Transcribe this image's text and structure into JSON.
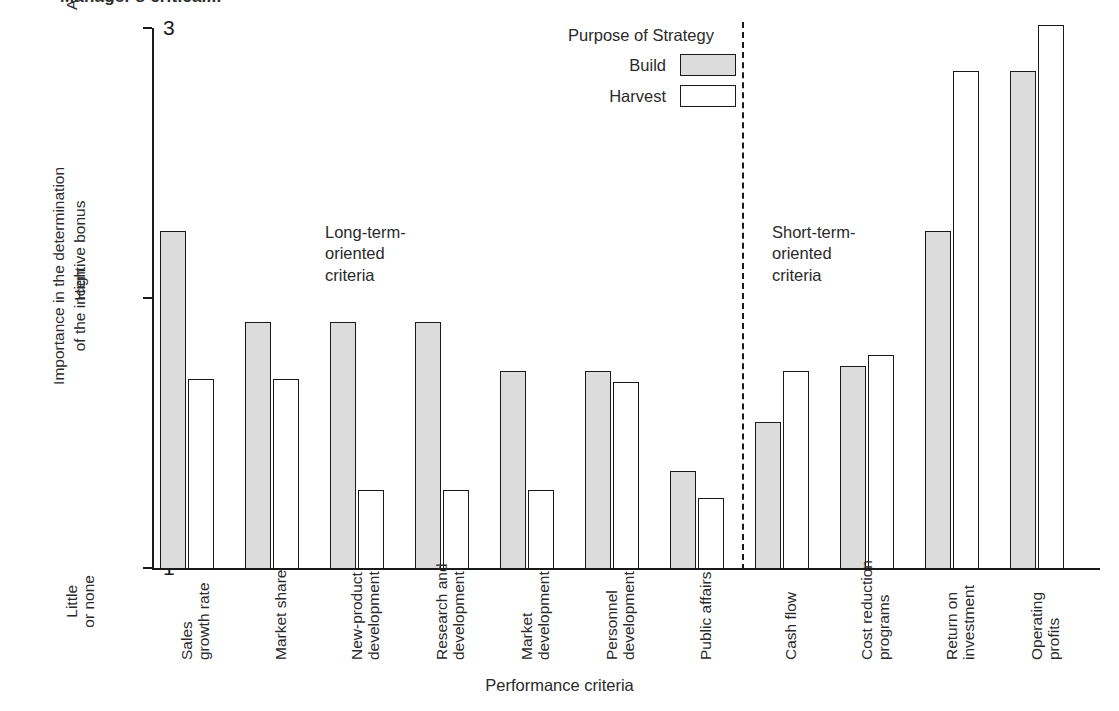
{
  "figure": {
    "cut_title": "Manager's critical...",
    "x_axis_title": "Performance criteria",
    "y_axis_title": "Importance in the determination\nof the incentive bonus",
    "annotations": [
      {
        "name": "long-term",
        "text": "Long-term-\noriented\ncriteria"
      },
      {
        "name": "short-term",
        "text": "Short-term-\noriented\ncriteria"
      }
    ],
    "legend": {
      "title": "Purpose of Strategy",
      "entries": [
        {
          "label": "Build",
          "swatch": "filled-gray",
          "color": "#dcdcdc"
        },
        {
          "label": "Harvest",
          "swatch": "white",
          "color": "#ffffff"
        }
      ]
    },
    "y_ticks": [
      {
        "value": "3",
        "words": "A great\ndeal"
      },
      {
        "value": "2",
        "words": "High"
      },
      {
        "value": "1",
        "words": "Little\nor none"
      }
    ]
  },
  "chart_data": {
    "type": "bar",
    "title": "",
    "xlabel": "Performance criteria",
    "ylabel": "Importance in the determination of the incentive bonus",
    "ylim": [
      1,
      3
    ],
    "ytick_values": [
      1,
      2,
      3
    ],
    "ytick_labels": [
      "Little or none",
      "High",
      "A great deal"
    ],
    "grid": false,
    "legend_position": "top-center",
    "categories": [
      "Sales growth rate",
      "Market share",
      "New-product development",
      "Research and development",
      "Market development",
      "Personnel development",
      "Public affairs",
      "Cash flow",
      "Cost reduction programs",
      "Return on investment",
      "Operating profits"
    ],
    "category_lines": [
      [
        "Sales",
        "growth rate"
      ],
      [
        "Market share"
      ],
      [
        "New-product",
        "development"
      ],
      [
        "Research and",
        "development"
      ],
      [
        "Market",
        "development"
      ],
      [
        "Personnel",
        "development"
      ],
      [
        "Public affairs"
      ],
      [
        "Cash flow"
      ],
      [
        "Cost reduction",
        "programs"
      ],
      [
        "Return on",
        "investment"
      ],
      [
        "Operating",
        "profits"
      ]
    ],
    "series": [
      {
        "name": "Build",
        "color": "#dcdcdc",
        "values": [
          2.25,
          1.91,
          1.91,
          1.91,
          1.73,
          1.73,
          1.36,
          1.54,
          1.75,
          2.25,
          2.84
        ]
      },
      {
        "name": "Harvest",
        "color": "#ffffff",
        "values": [
          1.7,
          1.7,
          1.29,
          1.29,
          1.29,
          1.69,
          1.26,
          1.73,
          1.79,
          2.84,
          3.01
        ]
      }
    ],
    "group_annotations": [
      {
        "label": "Long-term-oriented criteria",
        "categories": [
          0,
          1,
          2,
          3,
          4,
          5,
          6
        ]
      },
      {
        "label": "Short-term-oriented criteria",
        "categories": [
          7,
          8,
          9,
          10
        ]
      }
    ],
    "divider_after_category": "Public affairs"
  }
}
